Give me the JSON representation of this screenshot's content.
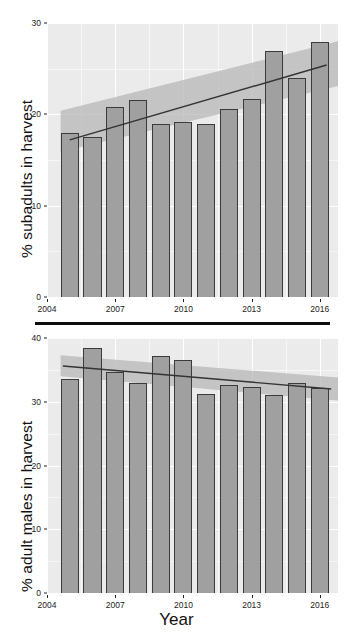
{
  "figure": {
    "xlabel": "Year",
    "panels": [
      {
        "id": "subadults",
        "ylabel": "% subadults in harvest",
        "yticks": [
          "0",
          "10",
          "20",
          "30"
        ],
        "xticks": [
          "2004",
          "2007",
          "2010",
          "2013",
          "2016"
        ]
      },
      {
        "id": "adult-males",
        "ylabel": "% adult males in harvest",
        "yticks": [
          "0",
          "10",
          "20",
          "30",
          "40"
        ],
        "xticks": [
          "2004",
          "2007",
          "2010",
          "2013",
          "2016"
        ]
      }
    ]
  },
  "colors": {
    "panel_background": "#ebebeb",
    "gridline_major": "#ffffff",
    "bar_fill": "#a0a0a0",
    "bar_outline": "#3b3b3b",
    "trend_line": "#333333",
    "ribbon_fill": "#b4b4b4",
    "axis_text": "#222222",
    "divider": "#0d0d0d"
  },
  "chart_data": [
    {
      "type": "bar",
      "id": "subadults",
      "title": "",
      "xlabel": "Year",
      "ylabel": "% subadults in harvest",
      "categories": [
        2005,
        2006,
        2007,
        2008,
        2009,
        2010,
        2011,
        2012,
        2013,
        2014,
        2015,
        2016
      ],
      "values": [
        18.0,
        17.5,
        20.8,
        21.6,
        18.9,
        19.2,
        18.9,
        20.6,
        21.7,
        26.9,
        24.0,
        27.9
      ],
      "ylim": [
        0,
        30
      ],
      "yticks": [
        0,
        10,
        20,
        30
      ],
      "xlim": [
        2004,
        2016.8
      ],
      "xticks": [
        2004,
        2007,
        2010,
        2013,
        2016
      ],
      "grid": true,
      "legend": "none",
      "overlays": [
        {
          "kind": "trend-line",
          "x": [
            2005.0,
            2016.3
          ],
          "y": [
            17.2,
            25.4
          ]
        },
        {
          "kind": "confidence-ribbon",
          "x": [
            2004.6,
            2016.8
          ],
          "y_lower": [
            15.9,
            23.1
          ],
          "y_upper": [
            20.4,
            28.0
          ]
        }
      ]
    },
    {
      "type": "bar",
      "id": "adult-males",
      "title": "",
      "xlabel": "Year",
      "ylabel": "% adult males in harvest",
      "categories": [
        2005,
        2006,
        2007,
        2008,
        2009,
        2010,
        2011,
        2012,
        2013,
        2014,
        2015,
        2016
      ],
      "values": [
        33.5,
        38.5,
        34.7,
        33.0,
        37.2,
        36.5,
        31.2,
        32.6,
        32.4,
        31.1,
        32.9,
        32.2
      ],
      "ylim": [
        0,
        40
      ],
      "yticks": [
        0,
        10,
        20,
        30,
        40
      ],
      "xlim": [
        2004,
        2016.8
      ],
      "xticks": [
        2004,
        2007,
        2010,
        2013,
        2016
      ],
      "grid": true,
      "legend": "none",
      "overlays": [
        {
          "kind": "trend-line",
          "x": [
            2004.7,
            2016.5
          ],
          "y": [
            35.6,
            32.0
          ]
        },
        {
          "kind": "confidence-ribbon",
          "x": [
            2004.6,
            2016.8
          ],
          "y_lower": [
            34.0,
            30.2
          ],
          "y_upper": [
            37.3,
            33.8
          ]
        }
      ]
    }
  ]
}
